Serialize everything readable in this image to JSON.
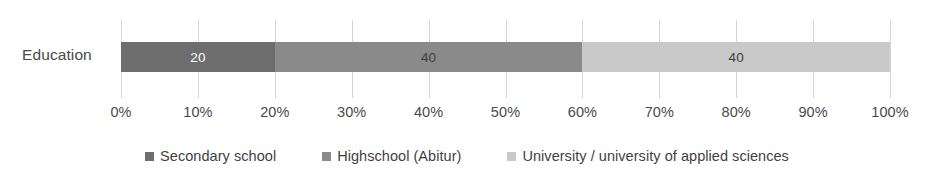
{
  "chart_data": {
    "type": "bar",
    "orientation": "horizontal",
    "stacked": true,
    "normalized_percent": true,
    "title": "",
    "subtitle": "",
    "xlabel": "",
    "ylabel": "",
    "categories": [
      "Education"
    ],
    "series": [
      {
        "name": "Secondary school",
        "values": [
          20
        ],
        "labels": [
          "20"
        ],
        "color": "#6e6e6e",
        "label_color": "#ffffff",
        "percent_start": 0,
        "percent_end": 20
      },
      {
        "name": "Highschool (Abitur)",
        "values": [
          40
        ],
        "labels": [
          "40"
        ],
        "color": "#8a8a8a",
        "label_color": "#3f3f3f",
        "percent_start": 20,
        "percent_end": 60
      },
      {
        "name": "University / university of applied sciences",
        "values": [
          40
        ],
        "labels": [
          "40"
        ],
        "color": "#c9c9c9",
        "label_color": "#3f3f3f",
        "percent_start": 60,
        "percent_end": 100
      }
    ],
    "xlim": [
      0,
      100
    ],
    "xticks": [
      0,
      10,
      20,
      30,
      40,
      50,
      60,
      70,
      80,
      90,
      100
    ],
    "xtick_labels": [
      "0%",
      "10%",
      "20%",
      "30%",
      "40%",
      "50%",
      "60%",
      "70%",
      "80%",
      "90%",
      "100%"
    ],
    "grid": {
      "vertical": true,
      "horizontal": false,
      "color": "#d5d5d5"
    },
    "legend": {
      "position": "bottom",
      "entries": [
        {
          "label": "Secondary school",
          "color": "#6e6e6e"
        },
        {
          "label": "Highschool (Abitur)",
          "color": "#8a8a8a"
        },
        {
          "label": "University / university of applied sciences",
          "color": "#c9c9c9"
        }
      ]
    },
    "background_color": "#ffffff",
    "text_color": "#4a4a4a"
  }
}
